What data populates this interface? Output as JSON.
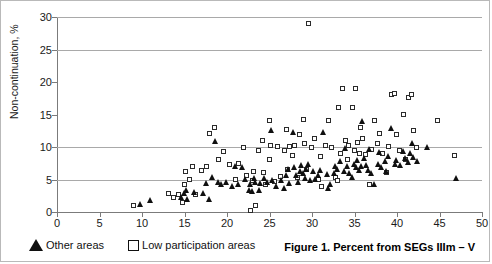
{
  "chart_data": {
    "type": "scatter",
    "title": "",
    "caption": "Figure 1. Percent from SEGs IIIm – V",
    "xlabel": "",
    "ylabel": "Non-continuation, %",
    "xlim": [
      0,
      50
    ],
    "ylim": [
      0,
      30
    ],
    "xticks": [
      0,
      5,
      10,
      15,
      20,
      25,
      30,
      35,
      40,
      45,
      50
    ],
    "yticks": [
      0,
      5,
      10,
      15,
      20,
      25,
      30
    ],
    "xtick_labels": [
      "0",
      "5",
      "10",
      "15",
      "20",
      "25",
      "30",
      "35",
      "40",
      "45",
      "50"
    ],
    "ytick_labels": [
      "0",
      "5",
      "10",
      "15",
      "20",
      "25",
      "30"
    ],
    "grid": "horizontal gridlines at y = 5, 10, 25, 30",
    "gridlines_y": [
      5,
      10,
      25,
      30
    ],
    "legend_position": "below plot, left",
    "series": [
      {
        "name": "Other areas",
        "marker": "filled-triangle",
        "color": "#101010",
        "points": [
          [
            9.8,
            1.2
          ],
          [
            11.0,
            1.8
          ],
          [
            14.6,
            2.2
          ],
          [
            15.0,
            2.8
          ],
          [
            15.2,
            3.4
          ],
          [
            15.4,
            2.0
          ],
          [
            16.2,
            3.0
          ],
          [
            17.2,
            2.8
          ],
          [
            17.6,
            4.4
          ],
          [
            18.0,
            2.0
          ],
          [
            18.3,
            5.3
          ],
          [
            18.6,
            10.8
          ],
          [
            19.0,
            4.6
          ],
          [
            19.4,
            4.2
          ],
          [
            20.0,
            4.6
          ],
          [
            20.6,
            4.0
          ],
          [
            21.0,
            7.0
          ],
          [
            21.4,
            4.2
          ],
          [
            21.8,
            6.9
          ],
          [
            22.2,
            5.0
          ],
          [
            22.6,
            3.4
          ],
          [
            22.8,
            4.3
          ],
          [
            23.0,
            3.2
          ],
          [
            23.2,
            5.2
          ],
          [
            23.4,
            4.6
          ],
          [
            23.8,
            3.3
          ],
          [
            24.0,
            4.4
          ],
          [
            24.4,
            5.1
          ],
          [
            24.8,
            4.6
          ],
          [
            25.2,
            12.5
          ],
          [
            25.4,
            4.8
          ],
          [
            25.8,
            4.0
          ],
          [
            26.4,
            4.9
          ],
          [
            26.8,
            3.6
          ],
          [
            27.0,
            5.6
          ],
          [
            27.2,
            6.5
          ],
          [
            27.4,
            4.4
          ],
          [
            27.8,
            12.3
          ],
          [
            28.0,
            6.8
          ],
          [
            28.2,
            5.6
          ],
          [
            28.4,
            4.6
          ],
          [
            28.6,
            6.2
          ],
          [
            28.8,
            7.2
          ],
          [
            29.0,
            6.0
          ],
          [
            29.2,
            5.2
          ],
          [
            29.4,
            6.6
          ],
          [
            29.6,
            7.4
          ],
          [
            29.8,
            4.8
          ],
          [
            30.2,
            6.2
          ],
          [
            30.4,
            5.0
          ],
          [
            30.8,
            5.6
          ],
          [
            31.0,
            6.4
          ],
          [
            31.4,
            12.3
          ],
          [
            31.8,
            5.8
          ],
          [
            32.0,
            3.6
          ],
          [
            32.2,
            4.3
          ],
          [
            32.6,
            5.9
          ],
          [
            32.8,
            7.0
          ],
          [
            33.0,
            6.6
          ],
          [
            33.4,
            7.8
          ],
          [
            33.8,
            6.2
          ],
          [
            34.0,
            9.8
          ],
          [
            34.2,
            7.0
          ],
          [
            34.4,
            6.0
          ],
          [
            34.8,
            5.4
          ],
          [
            35.0,
            7.4
          ],
          [
            35.2,
            6.8
          ],
          [
            35.4,
            8.0
          ],
          [
            35.6,
            6.4
          ],
          [
            35.8,
            7.0
          ],
          [
            36.0,
            14.0
          ],
          [
            36.2,
            8.2
          ],
          [
            36.4,
            7.2
          ],
          [
            36.6,
            6.4
          ],
          [
            36.8,
            9.6
          ],
          [
            37.0,
            6.0
          ],
          [
            37.4,
            4.2
          ],
          [
            37.8,
            7.4
          ],
          [
            38.0,
            9.2
          ],
          [
            38.2,
            6.8
          ],
          [
            38.6,
            7.8
          ],
          [
            38.8,
            6.2
          ],
          [
            39.0,
            8.6
          ],
          [
            39.4,
            12.8
          ],
          [
            39.8,
            7.4
          ],
          [
            40.0,
            8.0
          ],
          [
            40.4,
            7.2
          ],
          [
            40.8,
            9.4
          ],
          [
            41.0,
            8.2
          ],
          [
            41.4,
            7.6
          ],
          [
            41.6,
            9.0
          ],
          [
            41.8,
            10.6
          ],
          [
            42.0,
            8.4
          ],
          [
            42.4,
            7.8
          ],
          [
            43.6,
            9.9
          ],
          [
            47.0,
            5.1
          ]
        ]
      },
      {
        "name": "Low participation areas",
        "marker": "open-square",
        "color": "#2b2b2b",
        "points": [
          [
            9.1,
            0.9
          ],
          [
            13.2,
            2.8
          ],
          [
            13.8,
            2.2
          ],
          [
            14.4,
            2.6
          ],
          [
            14.8,
            1.4
          ],
          [
            15.0,
            4.2
          ],
          [
            15.2,
            6.2
          ],
          [
            15.6,
            5.0
          ],
          [
            16.0,
            7.0
          ],
          [
            16.4,
            2.6
          ],
          [
            17.0,
            6.3
          ],
          [
            17.6,
            7.0
          ],
          [
            18.0,
            12.0
          ],
          [
            18.6,
            13.0
          ],
          [
            19.0,
            8.0
          ],
          [
            19.6,
            9.2
          ],
          [
            20.4,
            7.2
          ],
          [
            21.0,
            5.0
          ],
          [
            21.4,
            7.4
          ],
          [
            22.0,
            9.8
          ],
          [
            22.4,
            5.6
          ],
          [
            22.8,
            0.2
          ],
          [
            23.0,
            4.8
          ],
          [
            23.2,
            6.2
          ],
          [
            23.4,
            1.0
          ],
          [
            23.8,
            9.4
          ],
          [
            24.2,
            11.0
          ],
          [
            24.4,
            6.0
          ],
          [
            24.6,
            4.2
          ],
          [
            25.0,
            8.0
          ],
          [
            25.0,
            14.0
          ],
          [
            25.2,
            10.2
          ],
          [
            25.6,
            4.6
          ],
          [
            26.0,
            10.0
          ],
          [
            26.4,
            5.4
          ],
          [
            26.8,
            9.4
          ],
          [
            27.0,
            12.6
          ],
          [
            27.2,
            6.4
          ],
          [
            27.4,
            10.0
          ],
          [
            27.8,
            8.6
          ],
          [
            28.0,
            10.2
          ],
          [
            28.4,
            5.2
          ],
          [
            28.6,
            11.8
          ],
          [
            29.0,
            14.2
          ],
          [
            29.2,
            10.4
          ],
          [
            29.4,
            6.4
          ],
          [
            29.6,
            28.9
          ],
          [
            30.0,
            9.8
          ],
          [
            30.4,
            11.2
          ],
          [
            30.8,
            5.0
          ],
          [
            31.0,
            8.4
          ],
          [
            31.2,
            3.8
          ],
          [
            31.6,
            10.2
          ],
          [
            32.0,
            14.0
          ],
          [
            32.4,
            9.8
          ],
          [
            32.8,
            5.2
          ],
          [
            33.0,
            4.8
          ],
          [
            33.2,
            16.0
          ],
          [
            33.4,
            9.0
          ],
          [
            33.6,
            19.0
          ],
          [
            34.0,
            11.0
          ],
          [
            34.2,
            8.0
          ],
          [
            34.4,
            10.2
          ],
          [
            34.8,
            16.0
          ],
          [
            35.0,
            9.4
          ],
          [
            35.2,
            19.0
          ],
          [
            35.4,
            10.6
          ],
          [
            35.6,
            9.0
          ],
          [
            35.8,
            13.0
          ],
          [
            36.0,
            11.2
          ],
          [
            36.4,
            8.8
          ],
          [
            36.8,
            4.2
          ],
          [
            37.0,
            9.6
          ],
          [
            37.4,
            14.0
          ],
          [
            37.8,
            10.4
          ],
          [
            38.0,
            12.0
          ],
          [
            38.4,
            9.0
          ],
          [
            38.8,
            6.0
          ],
          [
            39.0,
            10.0
          ],
          [
            39.4,
            18.0
          ],
          [
            39.8,
            18.2
          ],
          [
            40.0,
            11.8
          ],
          [
            40.4,
            9.4
          ],
          [
            40.8,
            15.0
          ],
          [
            41.0,
            8.0
          ],
          [
            41.4,
            17.6
          ],
          [
            41.8,
            18.0
          ],
          [
            42.0,
            12.4
          ],
          [
            42.4,
            9.8
          ],
          [
            44.8,
            14.0
          ],
          [
            46.8,
            8.6
          ]
        ]
      }
    ]
  },
  "legend": {
    "items": [
      {
        "label": "Other areas",
        "marker": "filled-triangle"
      },
      {
        "label": "Low participation areas",
        "marker": "open-square"
      }
    ]
  },
  "caption": {
    "text": "Figure 1. Percent from SEGs IIIm – V"
  },
  "axes": {
    "y_title": "Non-continuation, %"
  },
  "colors": {
    "grid": "#a9a9a9",
    "axis": "#7b7b7b",
    "marker_dark": "#101010",
    "background": "#ffffff"
  }
}
